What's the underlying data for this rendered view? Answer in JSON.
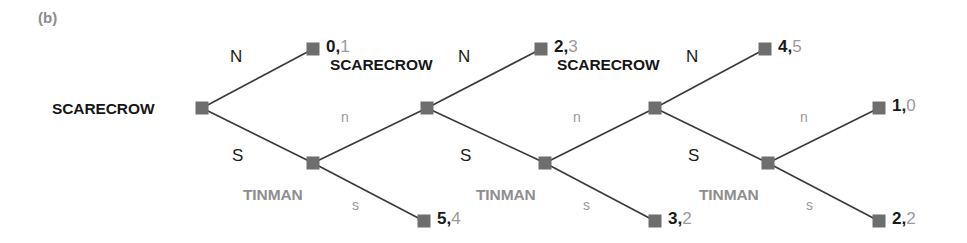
{
  "figure": {
    "panel_label": "(b)",
    "width": 967,
    "height": 243
  },
  "colors": {
    "node_fill": "#6e6e6e",
    "edge_stroke": "#3a3a3a",
    "scarecrow_text": "#161616",
    "tinman_text": "#8e8e8e",
    "upper_action_text": "#1a1a1a",
    "lower_action_text": "#9a9a9a",
    "payoff_player1": "#1a1a1a",
    "payoff_player2": "#9a9a9a",
    "panel_label_text": "#8c8c8c",
    "background": "#ffffff"
  },
  "players": {
    "player1": "SCARECROW",
    "player2": "TINMAN"
  },
  "labels": {
    "scarecrow_1": "SCARECROW",
    "scarecrow_2": "SCARECROW",
    "scarecrow_3": "SCARECROW",
    "tinman_1": "TINMAN",
    "tinman_2": "TINMAN",
    "tinman_3": "TINMAN"
  },
  "actions": {
    "n1_upper": "N",
    "n1_lower": "S",
    "t1_upper": "n",
    "t1_lower": "s",
    "n2_upper": "N",
    "n2_lower": "S",
    "t2_upper": "n",
    "t2_lower": "s",
    "n3_upper": "N",
    "n3_lower": "S",
    "t3_upper": "n",
    "t3_lower": "s"
  },
  "payoffs": {
    "p_0_1": {
      "player1": "0",
      "player2": "1",
      "separator": ","
    },
    "p_5_4": {
      "player1": "5",
      "player2": "4",
      "separator": ","
    },
    "p_2_3": {
      "player1": "2",
      "player2": "3",
      "separator": ","
    },
    "p_3_2": {
      "player1": "3",
      "player2": "2",
      "separator": ","
    },
    "p_4_5": {
      "player1": "4",
      "player2": "5",
      "separator": ","
    },
    "p_2_2": {
      "player1": "2",
      "player2": "2",
      "separator": ","
    },
    "p_1_0": {
      "player1": "1",
      "player2": "0",
      "separator": ","
    }
  },
  "chart_data": {
    "type": "diagram",
    "diagram_kind": "extensive-form-game-tree",
    "title": "(b)",
    "nodes": [
      {
        "id": "sc1",
        "player": "SCARECROW",
        "kind": "decision",
        "x": 202,
        "y": 108,
        "label_side": "left"
      },
      {
        "id": "term_0_1",
        "player": null,
        "kind": "terminal",
        "x": 313,
        "y": 49,
        "payoff": [
          0,
          1
        ]
      },
      {
        "id": "tm1",
        "player": "TINMAN",
        "kind": "decision",
        "x": 313,
        "y": 163,
        "label_side": "below-left"
      },
      {
        "id": "term_5_4",
        "player": null,
        "kind": "terminal",
        "x": 424,
        "y": 221,
        "payoff": [
          5,
          4
        ]
      },
      {
        "id": "sc2",
        "player": "SCARECROW",
        "kind": "decision",
        "x": 427,
        "y": 108,
        "label_side": "above-left"
      },
      {
        "id": "term_2_3",
        "player": null,
        "kind": "terminal",
        "x": 541,
        "y": 49,
        "payoff": [
          2,
          3
        ]
      },
      {
        "id": "tm2",
        "player": "TINMAN",
        "kind": "decision",
        "x": 545,
        "y": 163,
        "label_side": "below-left"
      },
      {
        "id": "term_3_2",
        "player": null,
        "kind": "terminal",
        "x": 655,
        "y": 221,
        "payoff": [
          3,
          2
        ]
      },
      {
        "id": "sc3",
        "player": "SCARECROW",
        "kind": "decision",
        "x": 655,
        "y": 108,
        "label_side": "above-left"
      },
      {
        "id": "term_4_5",
        "player": null,
        "kind": "terminal",
        "x": 765,
        "y": 49,
        "payoff": [
          4,
          5
        ]
      },
      {
        "id": "tm3",
        "player": "TINMAN",
        "kind": "decision",
        "x": 768,
        "y": 163,
        "label_side": "below-left"
      },
      {
        "id": "term_1_0",
        "player": null,
        "kind": "terminal",
        "x": 879,
        "y": 108,
        "payoff": [
          1,
          0
        ]
      },
      {
        "id": "term_2_2",
        "player": null,
        "kind": "terminal",
        "x": 879,
        "y": 221,
        "payoff": [
          2,
          2
        ]
      }
    ],
    "edges": [
      {
        "from": "sc1",
        "to": "term_0_1",
        "action": "N",
        "style": "upper"
      },
      {
        "from": "sc1",
        "to": "tm1",
        "action": "S",
        "style": "lower"
      },
      {
        "from": "tm1",
        "to": "sc2",
        "action": "n",
        "style": "upper"
      },
      {
        "from": "tm1",
        "to": "term_5_4",
        "action": "s",
        "style": "lower"
      },
      {
        "from": "sc2",
        "to": "term_2_3",
        "action": "N",
        "style": "upper"
      },
      {
        "from": "sc2",
        "to": "tm2",
        "action": "S",
        "style": "lower"
      },
      {
        "from": "tm2",
        "to": "sc3",
        "action": "n",
        "style": "upper"
      },
      {
        "from": "tm2",
        "to": "term_3_2",
        "action": "s",
        "style": "lower"
      },
      {
        "from": "sc3",
        "to": "term_4_5",
        "action": "N",
        "style": "upper"
      },
      {
        "from": "sc3",
        "to": "tm3",
        "action": "S",
        "style": "lower"
      },
      {
        "from": "tm3",
        "to": "term_1_0",
        "action": "n",
        "style": "upper"
      },
      {
        "from": "tm3",
        "to": "term_2_2",
        "action": "s",
        "style": "lower"
      }
    ],
    "terminal_payoffs": [
      {
        "label": "0,1",
        "player1": 0,
        "player2": 1
      },
      {
        "label": "5,4",
        "player1": 5,
        "player2": 4
      },
      {
        "label": "2,3",
        "player1": 2,
        "player2": 3
      },
      {
        "label": "3,2",
        "player1": 3,
        "player2": 2
      },
      {
        "label": "4,5",
        "player1": 4,
        "player2": 5
      },
      {
        "label": "1,0",
        "player1": 1,
        "player2": 0
      },
      {
        "label": "2,2",
        "player1": 2,
        "player2": 2
      }
    ]
  }
}
